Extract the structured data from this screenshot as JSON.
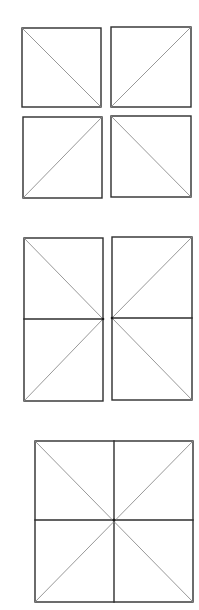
{
  "figure": {
    "background": "#ffffff",
    "edge_color": "#2e2e2e",
    "diagonal_color": "#8c8c8c",
    "groups": [
      {
        "id": "group-1-four-separate-squares",
        "shapes": [
          {
            "id": "g1-top-left",
            "rect": [
              22,
              28,
              101,
              107
            ],
            "diagonals": [
              [
                22,
                28,
                101,
                107
              ]
            ]
          },
          {
            "id": "g1-top-right",
            "rect": [
              111,
              27,
              191,
              107
            ],
            "diagonals": [
              [
                111,
                107,
                191,
                27
              ]
            ]
          },
          {
            "id": "g1-bottom-left",
            "rect": [
              23,
              117,
              102,
              198
            ],
            "diagonals": [
              [
                23,
                198,
                102,
                117
              ]
            ]
          },
          {
            "id": "g1-bottom-right",
            "rect": [
              111,
              116,
              191,
              197
            ],
            "diagonals": [
              [
                111,
                116,
                191,
                197
              ]
            ]
          }
        ]
      },
      {
        "id": "group-2-two-split-rectangles",
        "shapes": [
          {
            "id": "g2-left",
            "rect": [
              24,
              238,
              103,
              401
            ],
            "midline_y": 319,
            "diagonals": [
              [
                24,
                238,
                103,
                319
              ],
              [
                24,
                401,
                103,
                319
              ]
            ]
          },
          {
            "id": "g2-right",
            "rect": [
              112,
              237,
              192,
              400
            ],
            "midline_y": 318,
            "diagonals": [
              [
                112,
                318,
                192,
                237
              ],
              [
                112,
                318,
                192,
                400
              ]
            ]
          }
        ]
      },
      {
        "id": "group-3-combined-square",
        "shapes": [
          {
            "id": "g3-square",
            "rect": [
              35,
              441,
              193,
              602
            ],
            "center": [
              114,
              520
            ],
            "diagonals": [
              [
                35,
                441,
                193,
                602
              ],
              [
                35,
                602,
                193,
                441
              ]
            ]
          }
        ]
      }
    ]
  }
}
